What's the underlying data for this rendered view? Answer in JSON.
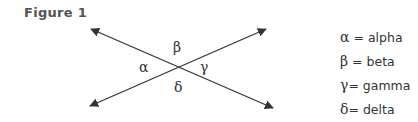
{
  "figure": {
    "title": "Figure 1",
    "angle_labels": {
      "top": "β",
      "left": "α",
      "right": "γ",
      "bottom": "δ"
    },
    "lines": [
      {
        "name": "line-1",
        "from": [
          91,
          29
        ],
        "to": [
          273,
          108
        ]
      },
      {
        "name": "line-2",
        "from": [
          90,
          106
        ],
        "to": [
          266,
          29
        ]
      }
    ],
    "line_color": "#333333"
  },
  "legend": {
    "items": [
      {
        "symbol": "α",
        "sep": " = ",
        "name": "alpha"
      },
      {
        "symbol": "β",
        "sep": " = ",
        "name": "beta"
      },
      {
        "symbol": "γ",
        "sep": "= ",
        "name": "gamma"
      },
      {
        "symbol": "δ",
        "sep": "= ",
        "name": "delta"
      }
    ]
  }
}
